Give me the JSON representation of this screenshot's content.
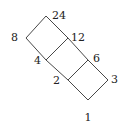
{
  "diagram": {
    "type": "hasse-diagram",
    "nodes": [
      {
        "id": "24",
        "label": "24",
        "x": 46,
        "y": 16,
        "lx": 52,
        "ly": 19,
        "anchor": "start"
      },
      {
        "id": "8",
        "label": "8",
        "x": 26,
        "y": 38,
        "lx": 18,
        "ly": 41,
        "anchor": "end"
      },
      {
        "id": "12",
        "label": "12",
        "x": 68,
        "y": 38,
        "lx": 71,
        "ly": 41,
        "anchor": "start"
      },
      {
        "id": "4",
        "label": "4",
        "x": 46,
        "y": 60,
        "lx": 41,
        "ly": 64,
        "anchor": "end"
      },
      {
        "id": "6",
        "label": "6",
        "x": 88,
        "y": 60,
        "lx": 93,
        "ly": 62,
        "anchor": "start"
      },
      {
        "id": "2",
        "label": "2",
        "x": 68,
        "y": 80,
        "lx": 60,
        "ly": 84,
        "anchor": "end"
      },
      {
        "id": "3",
        "label": "3",
        "x": 108,
        "y": 80,
        "lx": 111,
        "ly": 83,
        "anchor": "start"
      },
      {
        "id": "1",
        "label": "1",
        "x": 88,
        "y": 100,
        "lx": 88,
        "ly": 121,
        "anchor": "middle"
      }
    ],
    "edges": [
      [
        "24",
        "8"
      ],
      [
        "24",
        "12"
      ],
      [
        "8",
        "4"
      ],
      [
        "12",
        "4"
      ],
      [
        "12",
        "6"
      ],
      [
        "4",
        "2"
      ],
      [
        "6",
        "2"
      ],
      [
        "6",
        "3"
      ],
      [
        "2",
        "1"
      ],
      [
        "3",
        "1"
      ]
    ]
  }
}
